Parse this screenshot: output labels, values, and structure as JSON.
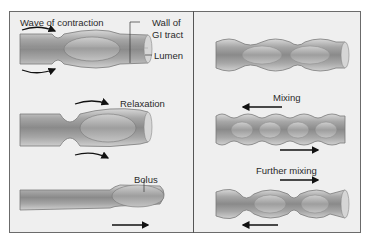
{
  "figure": {
    "left_panel": {
      "title": "Peristalsis",
      "labels": {
        "wave": "Wave of contraction",
        "wall_line1": "Wall of",
        "wall_line2": "GI tract",
        "lumen": "Lumen",
        "relaxation": "Relaxation",
        "bolus": "Bolus"
      }
    },
    "right_panel": {
      "title": "Segmentation",
      "labels": {
        "mixing": "Mixing",
        "further_mixing": "Further mixing"
      }
    },
    "colors": {
      "tube_wall": "#b9b9b9",
      "tube_inner": "#8e8e8e",
      "bolus": "#a9a9a9",
      "background": "#efefef",
      "border": "#6b6b6b",
      "arrow": "#111111"
    }
  }
}
